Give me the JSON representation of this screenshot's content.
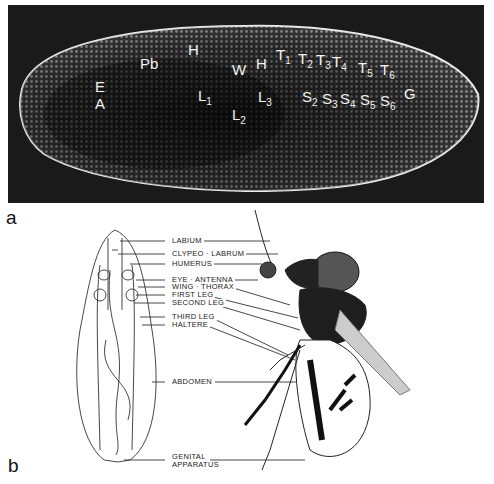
{
  "panel_a": {
    "letter": "a",
    "labels": [
      {
        "text": "E",
        "x": 95,
        "y": 87
      },
      {
        "text": "A",
        "x": 95,
        "y": 104
      },
      {
        "text": "Pb",
        "x": 140,
        "y": 64
      },
      {
        "text": "H",
        "x": 188,
        "y": 50
      },
      {
        "text": "W",
        "x": 232,
        "y": 70
      },
      {
        "text": "H",
        "x": 256,
        "y": 64
      },
      {
        "text": "T",
        "sub": "1",
        "x": 276,
        "y": 55
      },
      {
        "text": "T",
        "sub": "2",
        "x": 298,
        "y": 59
      },
      {
        "text": "T",
        "sub": "3",
        "x": 316,
        "y": 60
      },
      {
        "text": "T",
        "sub": "4",
        "x": 332,
        "y": 62
      },
      {
        "text": "T",
        "sub": "5",
        "x": 358,
        "y": 68
      },
      {
        "text": "T",
        "sub": "6",
        "x": 380,
        "y": 70
      },
      {
        "text": "G",
        "x": 404,
        "y": 94
      },
      {
        "text": "L",
        "sub": "1",
        "x": 198,
        "y": 96
      },
      {
        "text": "L",
        "sub": "2",
        "x": 232,
        "y": 115
      },
      {
        "text": "L",
        "sub": "3",
        "x": 258,
        "y": 97
      },
      {
        "text": "S",
        "sub": "2",
        "x": 302,
        "y": 97
      },
      {
        "text": "S",
        "sub": "3",
        "x": 322,
        "y": 99
      },
      {
        "text": "S",
        "sub": "4",
        "x": 340,
        "y": 99
      },
      {
        "text": "S",
        "sub": "5",
        "x": 360,
        "y": 100
      },
      {
        "text": "S",
        "sub": "6",
        "x": 380,
        "y": 101
      }
    ]
  },
  "panel_b": {
    "letter": "b",
    "callouts": {
      "labium": "LABIUM",
      "clypeo_labrum": "CLYPEO · LABRUM",
      "humerus": "HUMERUS",
      "eye_antenna": "EYE  ·  ANTENNA",
      "wing_thorax": "WING  ·  THORAX",
      "first_leg": "FIRST LEG",
      "second_leg": "SECOND LEG",
      "third_leg": "THIRD LEG",
      "haltere": "HALTERE",
      "abdomen": "ABDOMEN",
      "genital_1": "GENITAL",
      "genital_2": "APPARATUS"
    }
  }
}
